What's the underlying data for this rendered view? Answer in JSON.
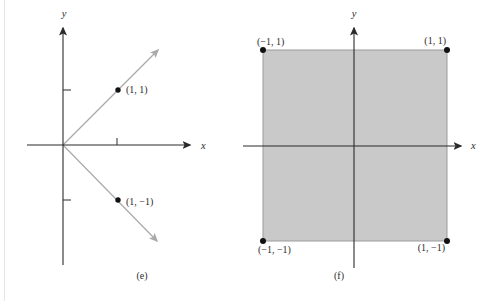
{
  "figure": {
    "panels": [
      {
        "caption": "(e)",
        "x_axis_label": "x",
        "y_axis_label": "y",
        "points": [
          {
            "label": "(1, 1)",
            "x": 1,
            "y": 1
          },
          {
            "label": "(1, −1)",
            "x": 1,
            "y": -1
          }
        ],
        "rays": [
          {
            "from": [
              0,
              0
            ],
            "through": [
              1,
              1
            ]
          },
          {
            "from": [
              0,
              0
            ],
            "through": [
              1,
              -1
            ]
          }
        ],
        "x_ticks": [
          1
        ],
        "y_ticks": [
          1,
          -1
        ]
      },
      {
        "caption": "(f)",
        "x_axis_label": "x",
        "y_axis_label": "y",
        "region": {
          "shape": "square",
          "x_range": [
            -1,
            1
          ],
          "y_range": [
            -1,
            1
          ]
        },
        "corners": [
          {
            "label": "(−1, 1)",
            "x": -1,
            "y": 1
          },
          {
            "label": "(1, 1)",
            "x": 1,
            "y": 1
          },
          {
            "label": "(−1, −1)",
            "x": -1,
            "y": -1
          },
          {
            "label": "(1, −1)",
            "x": 1,
            "y": -1
          }
        ]
      }
    ],
    "colors": {
      "axis": "#2b2b2b",
      "ray": "#a9a9a9",
      "region_fill": "#c9c9c9",
      "region_border": "#9b9b9b",
      "point_dot": "#111111",
      "background": "#ffffff"
    }
  }
}
